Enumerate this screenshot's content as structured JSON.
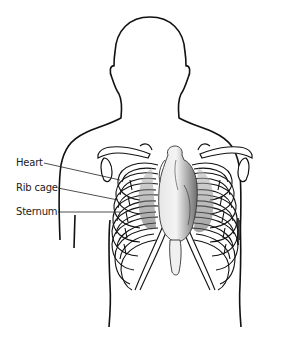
{
  "diagram": {
    "title": "",
    "labels": [
      {
        "id": "heart",
        "text": "Heart",
        "x": 16,
        "y": 158
      },
      {
        "id": "rib-cage",
        "text": "Rib cage",
        "x": 16,
        "y": 183
      },
      {
        "id": "sternum",
        "text": "Sternum",
        "x": 16,
        "y": 207
      }
    ],
    "colors": {
      "outline": "#111111",
      "heart_fill": "#d8d8d8",
      "heart_shadow": "#8a8a8a",
      "background": "#ffffff"
    }
  }
}
